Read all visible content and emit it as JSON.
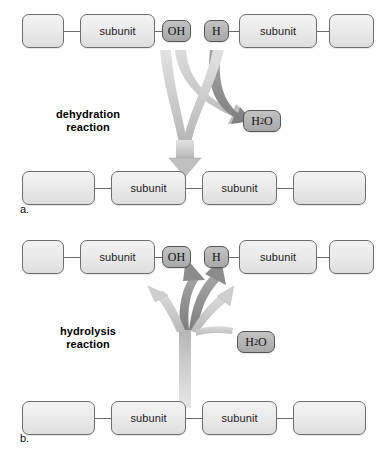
{
  "figure": {
    "background_color": "#ffffff",
    "subunit_fill": "#e9e9e9",
    "group_fill": "#b4b4b4",
    "stroke_color": "#6d6d6d",
    "arrow_light": "#c9c9c9",
    "arrow_dark": "#8c8c8c"
  },
  "panels": [
    {
      "letter": "a.",
      "reaction_label_line1": "dehydration",
      "reaction_label_line2": "reaction",
      "direction": "down",
      "reactant_row": {
        "items": [
          {
            "label": "",
            "kind": "blank"
          },
          {
            "label": "subunit",
            "kind": "subunit"
          },
          {
            "label": "OH",
            "kind": "group"
          },
          {
            "label": "H",
            "kind": "group"
          },
          {
            "label": "subunit",
            "kind": "subunit"
          },
          {
            "label": "",
            "kind": "blank"
          }
        ]
      },
      "product_row": {
        "items": [
          {
            "label": "",
            "kind": "blank"
          },
          {
            "label": "subunit",
            "kind": "subunit"
          },
          {
            "label": "subunit",
            "kind": "subunit"
          },
          {
            "label": "",
            "kind": "blank"
          }
        ]
      },
      "water": {
        "formula_pre": "H",
        "formula_sub": "2",
        "formula_post": "O",
        "role": "released"
      }
    },
    {
      "letter": "b.",
      "reaction_label_line1": "hydrolysis",
      "reaction_label_line2": "reaction",
      "direction": "up",
      "product_row": {
        "items": [
          {
            "label": "",
            "kind": "blank"
          },
          {
            "label": "subunit",
            "kind": "subunit"
          },
          {
            "label": "OH",
            "kind": "group"
          },
          {
            "label": "H",
            "kind": "group"
          },
          {
            "label": "subunit",
            "kind": "subunit"
          },
          {
            "label": "",
            "kind": "blank"
          }
        ]
      },
      "reactant_row": {
        "items": [
          {
            "label": "",
            "kind": "blank"
          },
          {
            "label": "subunit",
            "kind": "subunit"
          },
          {
            "label": "subunit",
            "kind": "subunit"
          },
          {
            "label": "",
            "kind": "blank"
          }
        ]
      },
      "water": {
        "formula_pre": "H",
        "formula_sub": "2",
        "formula_post": "O",
        "role": "consumed"
      }
    }
  ]
}
